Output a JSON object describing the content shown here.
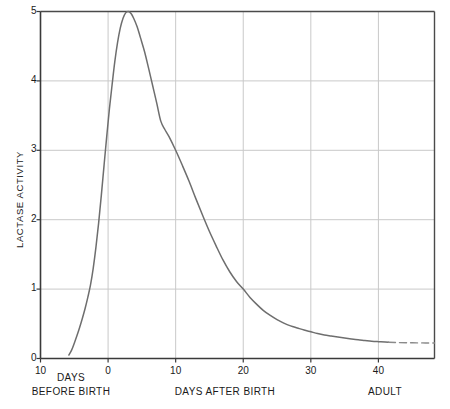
{
  "chart_data": {
    "type": "line",
    "title": "",
    "subtitle": "",
    "xlabel": "DAYS AFTER BIRTH",
    "ylabel": "LACTASE ACTIVITY",
    "xlim": [
      -10,
      48.3
    ],
    "ylim": [
      0,
      5
    ],
    "grid": true,
    "legend": "none",
    "x_ticks": [
      -10,
      0,
      10,
      20,
      30,
      40
    ],
    "x_tick_labels": [
      "10",
      "0",
      "10",
      "20",
      "30",
      "40"
    ],
    "y_ticks": [
      0,
      1,
      2,
      3,
      4,
      5
    ],
    "y_tick_labels": [
      "0",
      "1",
      "2",
      "3",
      "4",
      "5"
    ],
    "annotations": [
      {
        "id": "left-caption-line1",
        "text": "DAYS"
      },
      {
        "id": "left-caption-line2",
        "text": "BEFORE BIRTH"
      },
      {
        "id": "center-caption",
        "text": "DAYS AFTER BIRTH"
      },
      {
        "id": "right-caption",
        "text": "ADULT"
      }
    ],
    "series": [
      {
        "name": "Lactase activity (solid)",
        "style": "solid",
        "color": "#6e6e6e",
        "points": [
          [
            -5.8,
            0.05
          ],
          [
            -5.4,
            0.12
          ],
          [
            -5.0,
            0.22
          ],
          [
            -4.6,
            0.33
          ],
          [
            -4.2,
            0.45
          ],
          [
            -3.8,
            0.58
          ],
          [
            -3.4,
            0.72
          ],
          [
            -3.0,
            0.88
          ],
          [
            -2.6,
            1.06
          ],
          [
            -2.2,
            1.3
          ],
          [
            -1.8,
            1.6
          ],
          [
            -1.4,
            1.95
          ],
          [
            -1.0,
            2.35
          ],
          [
            -0.6,
            2.78
          ],
          [
            -0.2,
            3.2
          ],
          [
            0.2,
            3.6
          ],
          [
            0.6,
            3.95
          ],
          [
            1.0,
            4.28
          ],
          [
            1.4,
            4.55
          ],
          [
            1.8,
            4.76
          ],
          [
            2.2,
            4.9
          ],
          [
            2.6,
            4.98
          ],
          [
            3.0,
            5.0
          ],
          [
            3.4,
            4.97
          ],
          [
            3.8,
            4.9
          ],
          [
            4.3,
            4.78
          ],
          [
            4.8,
            4.62
          ],
          [
            5.4,
            4.42
          ],
          [
            6.0,
            4.18
          ],
          [
            6.6,
            3.93
          ],
          [
            7.2,
            3.68
          ],
          [
            7.8,
            3.42
          ],
          [
            8.4,
            3.3
          ],
          [
            9.0,
            3.2
          ],
          [
            10.0,
            3.0
          ],
          [
            11.0,
            2.78
          ],
          [
            12.0,
            2.55
          ],
          [
            13.0,
            2.3
          ],
          [
            14.0,
            2.06
          ],
          [
            15.0,
            1.83
          ],
          [
            16.0,
            1.62
          ],
          [
            17.0,
            1.42
          ],
          [
            18.0,
            1.25
          ],
          [
            19.0,
            1.11
          ],
          [
            20.0,
            1.0
          ],
          [
            21.0,
            0.88
          ],
          [
            22.0,
            0.78
          ],
          [
            23.0,
            0.69
          ],
          [
            24.0,
            0.62
          ],
          [
            25.0,
            0.56
          ],
          [
            26.0,
            0.51
          ],
          [
            27.0,
            0.47
          ],
          [
            28.0,
            0.44
          ],
          [
            29.0,
            0.41
          ],
          [
            30.0,
            0.385
          ],
          [
            31.0,
            0.36
          ],
          [
            32.0,
            0.34
          ],
          [
            33.0,
            0.325
          ],
          [
            34.0,
            0.31
          ],
          [
            35.0,
            0.295
          ],
          [
            36.0,
            0.282
          ],
          [
            37.0,
            0.27
          ],
          [
            38.0,
            0.26
          ],
          [
            39.0,
            0.25
          ],
          [
            40.0,
            0.243
          ],
          [
            41.0,
            0.237
          ],
          [
            41.5,
            0.234
          ]
        ]
      },
      {
        "name": "Lactase activity (adult, dashed)",
        "style": "dashed",
        "color": "#8a8a8a",
        "points": [
          [
            41.5,
            0.234
          ],
          [
            43.0,
            0.229
          ],
          [
            45.0,
            0.226
          ],
          [
            47.0,
            0.224
          ],
          [
            48.3,
            0.223
          ]
        ]
      }
    ],
    "peak": {
      "x": 3,
      "y": 5.0
    },
    "notable_crossings": [
      {
        "x": 10,
        "y": 3.0
      },
      {
        "x": 20,
        "y": 1.0
      }
    ],
    "colors": {
      "curve": "#6e6e6e",
      "grid": "#c9c9c9",
      "frame": "#4a4a4a",
      "text": "#1a1a1a",
      "background": "#ffffff"
    }
  }
}
